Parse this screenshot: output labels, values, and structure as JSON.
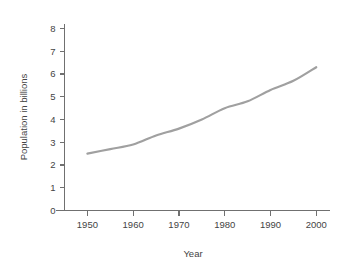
{
  "chart_data": {
    "type": "line",
    "title": "",
    "subtitle": "",
    "xlabel": "Year",
    "ylabel": "Population in billions",
    "x": [
      1950,
      1955,
      1960,
      1965,
      1970,
      1975,
      1980,
      1985,
      1990,
      1995,
      2000
    ],
    "series": [
      {
        "name": "World population",
        "color": "#a0a0a0",
        "values": [
          2.5,
          2.7,
          2.9,
          3.3,
          3.6,
          4.0,
          4.5,
          4.8,
          5.3,
          5.7,
          6.3
        ]
      }
    ],
    "xlim": [
      1945,
      2003
    ],
    "ylim": [
      0,
      8.2
    ],
    "xticks": [
      1950,
      1960,
      1970,
      1980,
      1990,
      2000
    ],
    "xtick_labels": [
      "1950",
      "1960",
      "1970",
      "1980",
      "1990",
      "2000"
    ],
    "yticks": [
      0,
      1,
      2,
      3,
      4,
      5,
      6,
      7,
      8
    ],
    "ytick_labels": [
      "0",
      "1",
      "2",
      "3",
      "4",
      "5",
      "6",
      "7",
      "8"
    ],
    "grid": false,
    "legend": false,
    "legend_position": "none",
    "annotations": [],
    "axis_color": "#707070",
    "background_color": "#ffffff",
    "line_color": "#a0a0a0"
  }
}
